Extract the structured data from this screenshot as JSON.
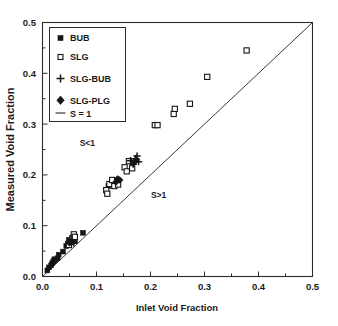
{
  "chart_data": {
    "type": "scatter",
    "title": "",
    "xlabel": "Inlet Void Fraction",
    "ylabel": "Measured Void Fraction",
    "xlim": [
      0.0,
      0.5
    ],
    "ylim": [
      0.0,
      0.5
    ],
    "xticks": [
      "0.0",
      "0.1",
      "0.2",
      "0.3",
      "0.4",
      "0.5"
    ],
    "xtick_values": [
      0.0,
      0.1,
      0.2,
      0.3,
      0.4,
      0.5
    ],
    "yticks": [
      "0.0",
      "0.1",
      "0.2",
      "0.3",
      "0.4",
      "0.5"
    ],
    "ytick_values": [
      0.0,
      0.1,
      0.2,
      0.3,
      0.4,
      0.5
    ],
    "minor_tick_step": 0.05,
    "grid": false,
    "legend_position": "upper-left",
    "annotations": [
      {
        "text": "S<1",
        "x": 0.083,
        "y": 0.257
      },
      {
        "text": "S>1",
        "x": 0.215,
        "y": 0.155
      }
    ],
    "reference_line": {
      "name": "S = 1",
      "label": "S = 1",
      "from": [
        0.0,
        0.0
      ],
      "to": [
        0.5,
        0.5
      ],
      "color": "#3a3a3a"
    },
    "series": [
      {
        "name": "BUB",
        "marker": "filled-square",
        "color": "#151515",
        "points": [
          [
            0.009,
            0.012
          ],
          [
            0.012,
            0.018
          ],
          [
            0.016,
            0.022
          ],
          [
            0.018,
            0.026
          ],
          [
            0.02,
            0.03
          ],
          [
            0.022,
            0.034
          ],
          [
            0.028,
            0.036
          ],
          [
            0.03,
            0.043
          ],
          [
            0.038,
            0.049
          ],
          [
            0.044,
            0.06
          ],
          [
            0.047,
            0.065
          ],
          [
            0.049,
            0.072
          ],
          [
            0.052,
            0.067
          ],
          [
            0.055,
            0.077
          ],
          [
            0.06,
            0.07
          ],
          [
            0.075,
            0.086
          ],
          [
            0.122,
            0.178
          ],
          [
            0.13,
            0.188
          ],
          [
            0.133,
            0.183
          ]
        ]
      },
      {
        "name": "SLG",
        "marker": "open-square",
        "color": "#151515",
        "points": [
          [
            0.049,
            0.062
          ],
          [
            0.055,
            0.073
          ],
          [
            0.058,
            0.083
          ],
          [
            0.06,
            0.078
          ],
          [
            0.118,
            0.17
          ],
          [
            0.12,
            0.163
          ],
          [
            0.124,
            0.182
          ],
          [
            0.129,
            0.19
          ],
          [
            0.133,
            0.178
          ],
          [
            0.14,
            0.181
          ],
          [
            0.152,
            0.215
          ],
          [
            0.156,
            0.207
          ],
          [
            0.16,
            0.227
          ],
          [
            0.166,
            0.213
          ],
          [
            0.208,
            0.298
          ],
          [
            0.213,
            0.298
          ],
          [
            0.243,
            0.32
          ],
          [
            0.245,
            0.33
          ],
          [
            0.273,
            0.34
          ],
          [
            0.305,
            0.393
          ],
          [
            0.378,
            0.445
          ]
        ]
      },
      {
        "name": "SLG-BUB",
        "marker": "plus",
        "color": "#151515",
        "points": [
          [
            0.055,
            0.069
          ],
          [
            0.058,
            0.066
          ],
          [
            0.163,
            0.228
          ],
          [
            0.168,
            0.221
          ],
          [
            0.172,
            0.232
          ],
          [
            0.175,
            0.237
          ],
          [
            0.178,
            0.226
          ]
        ]
      },
      {
        "name": "SLG-PLG",
        "marker": "diamond",
        "color": "#151515",
        "points": [
          [
            0.02,
            0.028
          ],
          [
            0.023,
            0.031
          ],
          [
            0.05,
            0.066
          ],
          [
            0.053,
            0.07
          ],
          [
            0.136,
            0.186
          ],
          [
            0.139,
            0.192
          ],
          [
            0.143,
            0.19
          ],
          [
            0.17,
            0.225
          ],
          [
            0.174,
            0.23
          ]
        ]
      }
    ]
  },
  "legend": {
    "items": [
      {
        "label": "BUB",
        "marker": "filled-square"
      },
      {
        "label": "SLG",
        "marker": "open-square"
      },
      {
        "label": "SLG-BUB",
        "marker": "plus"
      },
      {
        "label": "SLG-PLG",
        "marker": "diamond"
      },
      {
        "label": "S = 1",
        "marker": "line"
      }
    ]
  },
  "axes": {
    "x_title": "Inlet Void Fraction",
    "y_title": "Measured Void Fraction",
    "x_tick_0": "0.0",
    "x_tick_1": "0.1",
    "x_tick_2": "0.2",
    "x_tick_3": "0.3",
    "x_tick_4": "0.4",
    "x_tick_5": "0.5",
    "y_tick_0": "0.0",
    "y_tick_1": "0.1",
    "y_tick_2": "0.2",
    "y_tick_3": "0.3",
    "y_tick_4": "0.4",
    "y_tick_5": "0.5"
  },
  "annotation_labels": {
    "s_less_than_one": "S<1",
    "s_greater_than_one": "S>1"
  }
}
